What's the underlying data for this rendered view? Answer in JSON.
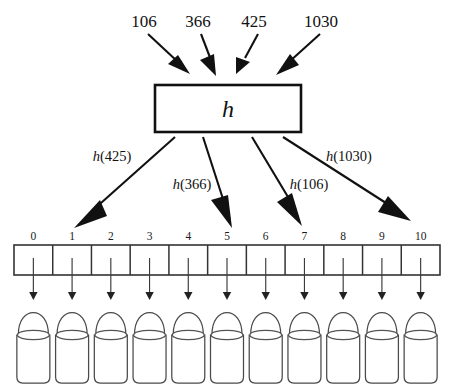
{
  "diagram": {
    "type": "hash-table",
    "colors": {
      "stroke": "#1a1a1a",
      "arrow": "#111111",
      "bucket_stroke": "#4a4a4a",
      "background": "#ffffff"
    }
  },
  "keys": [
    {
      "label": "106",
      "x": 144,
      "y": 22
    },
    {
      "label": "366",
      "x": 198,
      "y": 22
    },
    {
      "label": "425",
      "x": 254,
      "y": 22
    },
    {
      "label": "1030",
      "x": 321,
      "y": 22
    }
  ],
  "hash_box": {
    "label": "h",
    "x": 155,
    "y": 85,
    "width": 146,
    "height": 47
  },
  "hash_results": [
    {
      "label_fn": "h",
      "label_arg": "(425)",
      "x": 112,
      "y": 161,
      "target_index": 1
    },
    {
      "label_fn": "h",
      "label_arg": "(366)",
      "x": 192,
      "y": 186,
      "target_index": 5
    },
    {
      "label_fn": "h",
      "label_arg": "(106)",
      "x": 307,
      "y": 186,
      "target_index": 7
    },
    {
      "label_fn": "h",
      "label_arg": "(1030)",
      "x": 347,
      "y": 158,
      "target_index": 9
    }
  ],
  "array": {
    "x": 14,
    "y": 245,
    "width": 426,
    "height": 30,
    "cell_count": 11,
    "indices": [
      "0",
      "1",
      "2",
      "3",
      "4",
      "5",
      "6",
      "7",
      "8",
      "9",
      "10"
    ]
  },
  "buckets": {
    "count": 11,
    "top": 303,
    "height": 80,
    "width": 33,
    "dome_height": 32,
    "rim_offset": 32
  },
  "cell_arrows": {
    "from_y": 258,
    "to_y": 300,
    "count": 11
  }
}
